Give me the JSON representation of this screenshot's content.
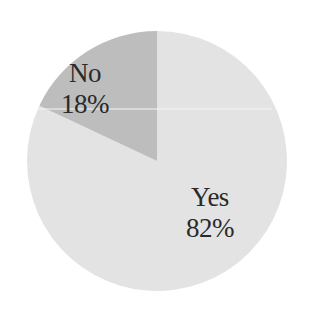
{
  "chart_data": {
    "type": "pie",
    "title": "",
    "categories": [
      "Yes",
      "No"
    ],
    "values": [
      82,
      18
    ],
    "labels": [
      {
        "name": "Yes",
        "percent": "82%"
      },
      {
        "name": "No",
        "percent": "18%"
      }
    ],
    "colors": [
      "#e3e3e3",
      "#bdbdbd"
    ],
    "start_angle_deg": 0,
    "direction": "clockwise-from-top (No slice occupies the top-left, ending at 12 o'clock)",
    "legend": "none",
    "data_labels": "inside slices, name above percentage"
  },
  "labels": {
    "no_name": "No",
    "no_percent": "18%",
    "yes_name": "Yes",
    "yes_percent": "82%"
  }
}
